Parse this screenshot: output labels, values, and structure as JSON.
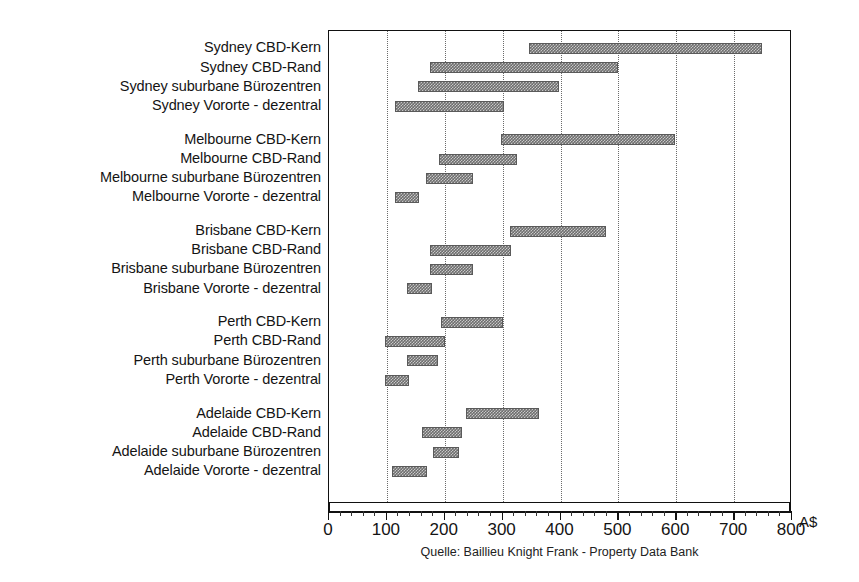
{
  "chart_data": {
    "type": "bar",
    "orientation": "horizontal",
    "subtype": "range-bar",
    "title": "",
    "xlabel": "A$",
    "ylabel": "",
    "xlim": [
      0,
      800
    ],
    "xticks": [
      0,
      100,
      200,
      300,
      400,
      500,
      600,
      700,
      800
    ],
    "xtick_labels": [
      "0",
      "100",
      "200",
      "300",
      "400",
      "500",
      "600",
      "700",
      "800"
    ],
    "minor_tick_step": 20,
    "grid": "vertical-dotted",
    "legend": "none",
    "unit_label": "A$",
    "source_note": "Quelle: Baillieu Knight Frank - Property Data Bank",
    "bar_color": "#6e6e6e",
    "grid_color": "#6b6b6b",
    "axis_color": "#111111",
    "groups": [
      {
        "name": "Sydney",
        "items": [
          {
            "label": "Sydney CBD-Kern",
            "low": 345,
            "high": 748
          },
          {
            "label": "Sydney CBD-Rand",
            "low": 175,
            "high": 499
          },
          {
            "label": "Sydney suburbane Bürozentren",
            "low": 153,
            "high": 397
          },
          {
            "label": "Sydney Vororte - dezentral",
            "low": 114,
            "high": 303
          }
        ]
      },
      {
        "name": "Melbourne",
        "items": [
          {
            "label": "Melbourne CBD-Kern",
            "low": 297,
            "high": 597
          },
          {
            "label": "Melbourne CBD-Rand",
            "low": 190,
            "high": 324
          },
          {
            "label": "Melbourne suburbane Bürozentren",
            "low": 168,
            "high": 249
          },
          {
            "label": "Melbourne Vororte - dezentral",
            "low": 114,
            "high": 156
          }
        ]
      },
      {
        "name": "Brisbane",
        "items": [
          {
            "label": "Brisbane CBD-Kern",
            "low": 313,
            "high": 479
          },
          {
            "label": "Brisbane CBD-Rand",
            "low": 175,
            "high": 315
          },
          {
            "label": "Brisbane suburbane Bürozentren",
            "low": 175,
            "high": 249
          },
          {
            "label": "Brisbane Vororte - dezentral",
            "low": 134,
            "high": 178
          }
        ]
      },
      {
        "name": "Perth",
        "items": [
          {
            "label": "Perth CBD-Kern",
            "low": 194,
            "high": 300
          },
          {
            "label": "Perth CBD-Rand",
            "low": 96,
            "high": 200
          },
          {
            "label": "Perth suburbane Bürozentren",
            "low": 134,
            "high": 188
          },
          {
            "label": "Perth Vororte - dezentral",
            "low": 97,
            "high": 138
          }
        ]
      },
      {
        "name": "Adelaide",
        "items": [
          {
            "label": "Adelaide CBD-Kern",
            "low": 236,
            "high": 362
          },
          {
            "label": "Adelaide CBD-Rand",
            "low": 160,
            "high": 230
          },
          {
            "label": "Adelaide suburbane Bürozentren",
            "low": 180,
            "high": 224
          },
          {
            "label": "Adelaide Vororte - dezentral",
            "low": 109,
            "high": 170
          }
        ]
      }
    ]
  }
}
